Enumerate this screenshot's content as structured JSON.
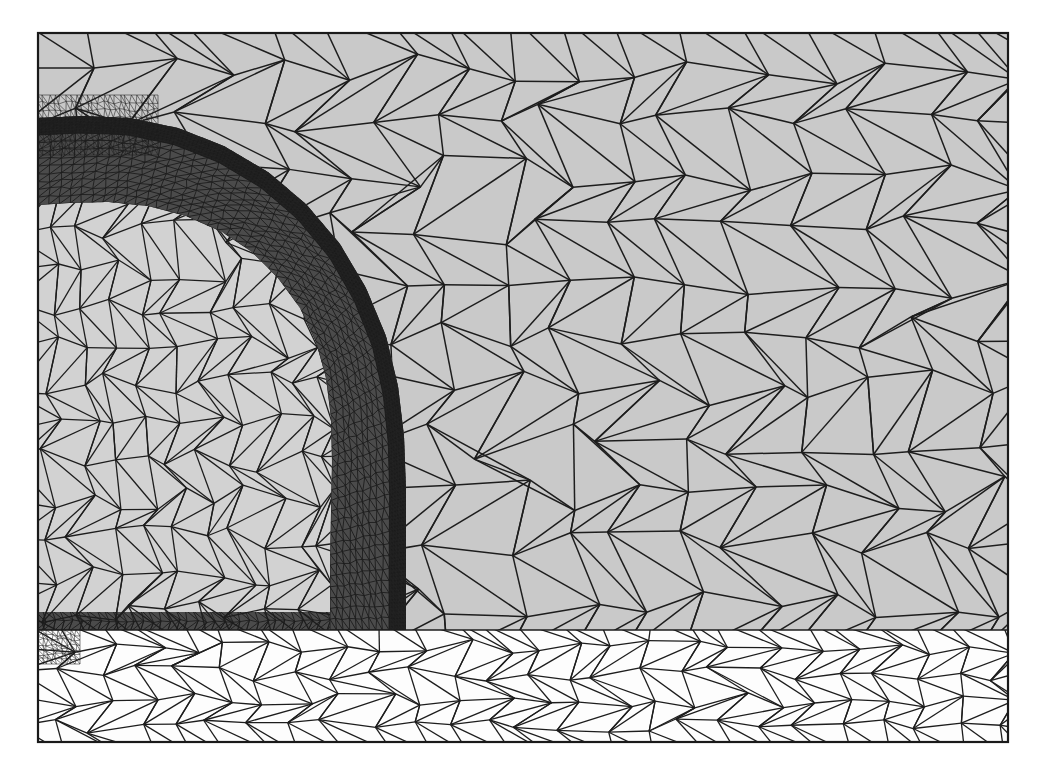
{
  "figure": {
    "kind": "finite-element-mesh",
    "caption": "",
    "canvas": {
      "width": 1040,
      "height": 766,
      "background": "#ffffff"
    },
    "frame": {
      "x": 38,
      "y": 33,
      "width": 970,
      "height": 709,
      "stroke": "#1a1a1a",
      "stroke_width": 2.2
    }
  },
  "palette": {
    "outer_field": "#c9c9c9",
    "inner_core": "#d2d2d2",
    "boundary_layer_band": "#4b4b4b",
    "dense_sublayer": "#232323",
    "lower_plenum": "#fdfdfd",
    "lower_plenum_mid": "#f6f6f6",
    "mesh_line": "#1d1d1d",
    "frame_line": "#1a1a1a",
    "wall_strip": "#4b4b4b"
  },
  "regions": [
    {
      "id": "outer-field",
      "label": "outer coarse far-field region",
      "fill": "#c9c9c9",
      "mesh_density": "coarse",
      "approx_cell_size_px": 62
    },
    {
      "id": "inner-core",
      "label": "inner core region inside curved wall",
      "fill": "#d2d2d2",
      "mesh_density": "medium",
      "approx_cell_size_px": 30
    },
    {
      "id": "boundary-layer-band",
      "label": "curved refined boundary-layer band",
      "fill": "#4b4b4b",
      "mesh_density": "fine",
      "approx_cell_size_px": 11
    },
    {
      "id": "dense-sublayer",
      "label": "very dense viscous sublayer strip on outer edge of band",
      "fill": "#232323",
      "mesh_density": "very-fine",
      "approx_cell_size_px": 4
    },
    {
      "id": "wall-strip",
      "label": "thin horizontal wall boundary strip lower left",
      "fill": "#4b4b4b",
      "mesh_density": "fine",
      "approx_cell_size_px": 9
    },
    {
      "id": "lower-plenum",
      "label": "lower white plenum region",
      "fill": "#fdfdfd",
      "mesh_density": "medium",
      "approx_cell_size_px": 34
    }
  ],
  "geometry": {
    "band_inner_arc": {
      "description": "inner edge of curved refined band (elbow)",
      "points": [
        [
          38,
          205
        ],
        [
          70,
          203
        ],
        [
          108,
          202
        ],
        [
          148,
          206
        ],
        [
          186,
          216
        ],
        [
          222,
          232
        ],
        [
          252,
          252
        ],
        [
          278,
          278
        ],
        [
          300,
          308
        ],
        [
          316,
          342
        ],
        [
          326,
          378
        ],
        [
          331,
          418
        ],
        [
          332,
          462
        ],
        [
          331,
          512
        ],
        [
          330,
          566
        ],
        [
          330,
          612
        ],
        [
          330,
          630
        ]
      ]
    },
    "band_outer_arc": {
      "description": "outer edge of curved refined band (dense sublayer outer limit)",
      "points": [
        [
          38,
          118
        ],
        [
          82,
          116
        ],
        [
          130,
          118
        ],
        [
          178,
          128
        ],
        [
          224,
          146
        ],
        [
          268,
          172
        ],
        [
          306,
          204
        ],
        [
          340,
          244
        ],
        [
          366,
          288
        ],
        [
          386,
          336
        ],
        [
          398,
          386
        ],
        [
          404,
          436
        ],
        [
          406,
          490
        ],
        [
          406,
          546
        ],
        [
          406,
          596
        ],
        [
          406,
          630
        ]
      ]
    },
    "dense_strip": {
      "description": "near-black very fine sublayer hugging the outer arc",
      "thickness_px": 17,
      "follows": "band_outer_arc"
    },
    "horizontal_interface": {
      "description": "horizontal line separating gray upper field from white lower plenum",
      "y": 630,
      "x_from": 38,
      "x_to": 1008
    },
    "wall_strip": {
      "description": "thin dark horizontal boundary-layer strip along the left wall",
      "x_from": 38,
      "x_to": 330,
      "y_top": 612,
      "y_bottom": 630
    },
    "left_corner_cluster": {
      "description": "small dense node cluster at left edge just below interface",
      "x": 38,
      "y": 630,
      "width": 42,
      "height": 34
    },
    "top_left_cluster": {
      "description": "refined cluster where band meets top-left frame edge",
      "x": 38,
      "y": 95,
      "width": 120,
      "height": 60
    }
  },
  "mesh_params": {
    "seed": 20240517,
    "line_width_coarse": 1.5,
    "line_width_medium": 1.3,
    "line_width_fine": 0.9,
    "line_width_very_fine": 0.55,
    "jitter": 0.34,
    "columns_coarse": 17,
    "rows_coarse": 12,
    "columns_medium": 13,
    "rows_medium": 15,
    "band_layers": 9,
    "band_along": 58,
    "dense_layers": 6,
    "dense_along": 190,
    "lower_columns": 26,
    "lower_rows": 5
  }
}
